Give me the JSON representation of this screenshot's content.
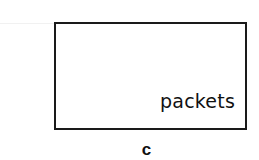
{
  "diagram": {
    "box": {
      "label": "packets",
      "border_color": "#1a1a1a"
    },
    "caption": "c"
  }
}
